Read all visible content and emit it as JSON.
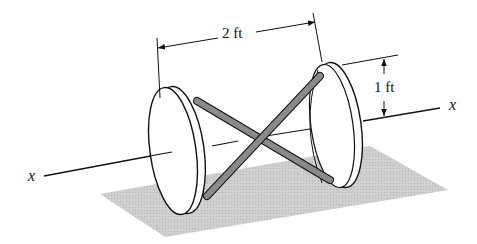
{
  "diagram": {
    "labels": {
      "length_dimension": "2 ft",
      "radius_dimension": "1 ft",
      "axis_left": "x",
      "axis_right": "x"
    },
    "colors": {
      "line": "#111111",
      "rod_fill": "#8a8a8a",
      "shadow": "#c9c9c9",
      "disk_fill": "#ffffff"
    }
  }
}
